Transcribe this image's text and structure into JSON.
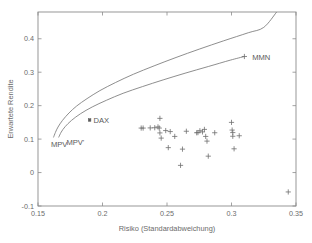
{
  "chart_data": {
    "type": "scatter",
    "title": "",
    "xlabel": "Risiko (Standardabweichung)",
    "ylabel": "Erwartete Rendite",
    "xlim": [
      0.15,
      0.35
    ],
    "ylim": [
      -0.1,
      0.48
    ],
    "xticks": [
      0.15,
      0.2,
      0.25,
      0.3,
      0.35
    ],
    "xtick_labels": [
      "0.15",
      "0.2",
      "0.25",
      "0.3",
      "0.35"
    ],
    "yticks": [
      -0.1,
      0,
      0.1,
      0.2,
      0.3,
      0.4
    ],
    "ytick_labels": [
      "-0.1",
      "0",
      "0.1",
      "0.2",
      "0.3",
      "0.4"
    ],
    "grid": false,
    "legend": "none",
    "series": [
      {
        "name": "Effizienzkurve oben",
        "type": "line",
        "points": [
          [
            0.162,
            0.105
          ],
          [
            0.1635,
            0.12
          ],
          [
            0.1655,
            0.136
          ],
          [
            0.169,
            0.156
          ],
          [
            0.174,
            0.178
          ],
          [
            0.18,
            0.199
          ],
          [
            0.188,
            0.221
          ],
          [
            0.198,
            0.245
          ],
          [
            0.21,
            0.269
          ],
          [
            0.224,
            0.294
          ],
          [
            0.24,
            0.319
          ],
          [
            0.257,
            0.344
          ],
          [
            0.275,
            0.369
          ],
          [
            0.294,
            0.394
          ],
          [
            0.313,
            0.418
          ],
          [
            0.325,
            0.434
          ],
          [
            0.335,
            0.48
          ]
        ]
      },
      {
        "name": "Effizienzkurve unten",
        "type": "line",
        "points": [
          [
            0.166,
            0.105
          ],
          [
            0.168,
            0.121
          ],
          [
            0.171,
            0.137
          ],
          [
            0.176,
            0.156
          ],
          [
            0.183,
            0.176
          ],
          [
            0.192,
            0.196
          ],
          [
            0.203,
            0.216
          ],
          [
            0.216,
            0.237
          ],
          [
            0.231,
            0.257
          ],
          [
            0.247,
            0.277
          ],
          [
            0.264,
            0.297
          ],
          [
            0.282,
            0.317
          ],
          [
            0.299,
            0.336
          ],
          [
            0.31,
            0.347
          ]
        ]
      },
      {
        "name": "Einzeltitel",
        "type": "scatter",
        "marker": "plus",
        "points": [
          [
            0.23,
            0.133
          ],
          [
            0.2315,
            0.133
          ],
          [
            0.237,
            0.1335
          ],
          [
            0.2405,
            0.134
          ],
          [
            0.243,
            0.1365
          ],
          [
            0.2445,
            0.162
          ],
          [
            0.244,
            0.133
          ],
          [
            0.2445,
            0.1185
          ],
          [
            0.2455,
            0.103
          ],
          [
            0.249,
            0.1255
          ],
          [
            0.251,
            0.0745
          ],
          [
            0.2525,
            0.1225
          ],
          [
            0.256,
            0.108
          ],
          [
            0.2605,
            0.0215
          ],
          [
            0.262,
            0.07
          ],
          [
            0.265,
            0.1235
          ],
          [
            0.273,
            0.119
          ],
          [
            0.274,
            0.1195
          ],
          [
            0.2755,
            0.125
          ],
          [
            0.2775,
            0.1215
          ],
          [
            0.279,
            0.129
          ],
          [
            0.28,
            0.108
          ],
          [
            0.281,
            0.094
          ],
          [
            0.282,
            0.049
          ],
          [
            0.287,
            0.119
          ],
          [
            0.3,
            0.15
          ],
          [
            0.3005,
            0.127
          ],
          [
            0.301,
            0.1195
          ],
          [
            0.301,
            0.1085
          ],
          [
            0.302,
            0.071
          ],
          [
            0.306,
            0.11
          ],
          [
            0.344,
            -0.058
          ]
        ]
      },
      {
        "name": "DAX",
        "type": "scatter",
        "marker": "square",
        "points": [
          [
            0.19,
            0.157
          ]
        ]
      },
      {
        "name": "MMN",
        "type": "scatter",
        "marker": "plus",
        "points": [
          [
            0.31,
            0.347
          ]
        ]
      }
    ],
    "annotations": [
      {
        "id": "mpv",
        "text": "MPV",
        "x": 0.16,
        "y": 0.076,
        "anchor": "start"
      },
      {
        "id": "mpv-prime",
        "text": "MPV'",
        "x": 0.172,
        "y": 0.082,
        "anchor": "start"
      },
      {
        "id": "dax",
        "text": "DAX",
        "x": 0.193,
        "y": 0.148,
        "anchor": "start"
      },
      {
        "id": "mmn",
        "text": "MMN",
        "x": 0.316,
        "y": 0.337,
        "anchor": "start"
      }
    ]
  },
  "colors": {
    "axis": "#8c8c8c",
    "curve": "#7a7a7a",
    "marker": "#6e6e6e",
    "text": "#6b6b6b",
    "background": "#ffffff"
  }
}
